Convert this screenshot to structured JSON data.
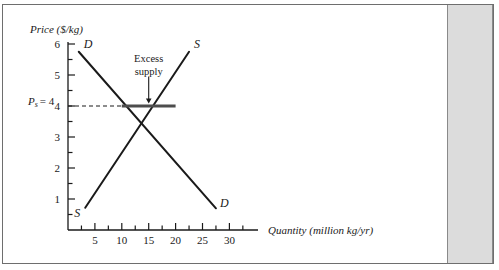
{
  "figure": {
    "background_color": "#ffffff",
    "frame_color": "#6e6e6e",
    "side_band_color": "#dcdcdc",
    "curve_color": "#1a1a1a",
    "support_line_color": "#4d4d4d"
  },
  "chart_data": {
    "type": "line",
    "title": "",
    "xlabel": "Quantity (million kg/yr)",
    "ylabel": "Price ($/kg)",
    "xlim": [
      0,
      35
    ],
    "ylim": [
      0,
      6
    ],
    "grid": false,
    "legend_position": "inline-curve-labels",
    "x_ticks_major": [
      5,
      10,
      15,
      20,
      25,
      30
    ],
    "x_tick_labels": [
      "5",
      "10",
      "15",
      "20",
      "25",
      "30"
    ],
    "x_ticks_minor_step": 2.5,
    "y_ticks_major": [
      1,
      2,
      3,
      4,
      5,
      6
    ],
    "y_tick_labels": [
      "1",
      "2",
      "3",
      "4",
      "5",
      "6"
    ],
    "y_ticks_minor_step": 0.5,
    "series": [
      {
        "name": "Demand",
        "label": "D",
        "label_start": "D",
        "label_end": "D",
        "points": [
          [
            2,
            5.75
          ],
          [
            27.5,
            0.7
          ]
        ],
        "style": "solid"
      },
      {
        "name": "Supply",
        "label": "S",
        "label_start": "S",
        "label_end": "S",
        "points": [
          [
            3.2,
            0.72
          ],
          [
            22.5,
            5.75
          ]
        ],
        "style": "solid"
      }
    ],
    "equilibrium": {
      "quantity": 15,
      "price": 3
    },
    "support_price": {
      "value": 4,
      "label": "P",
      "label_subscript": "s",
      "label_equals": "= 4",
      "line_from_q": 10,
      "line_to_q": 20,
      "dashed_from_q": 0,
      "dashed_to_q": 10
    },
    "annotations": [
      {
        "name": "excess-supply",
        "text_line_1": "Excess",
        "text_line_2": "supply",
        "arrow_from": [
          15,
          4.95
        ],
        "arrow_to": [
          15,
          4.08
        ]
      }
    ]
  }
}
